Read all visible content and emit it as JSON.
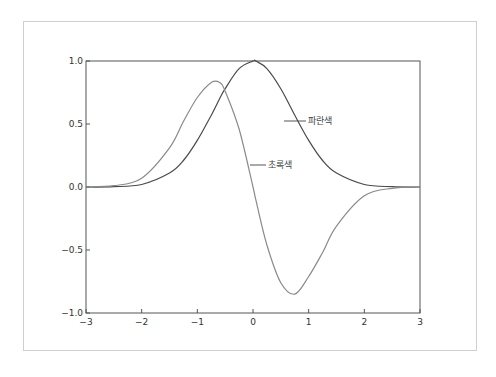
{
  "title": "",
  "chart_data": {
    "type": "line",
    "title": "",
    "xlabel": "",
    "ylabel": "",
    "xlim": [
      -3,
      3
    ],
    "ylim": [
      -1.0,
      1.0
    ],
    "grid": false,
    "legend": "none (inline annotations)",
    "x_ticks": [
      "−3",
      "−2",
      "−1",
      "0",
      "1",
      "2",
      "3"
    ],
    "y_ticks": [
      "1.0",
      "0.5",
      "0.0",
      "−0.5",
      "−1.0"
    ],
    "x": [
      -3.0,
      -2.5,
      -2.0,
      -1.5,
      -1.25,
      -1.0,
      -0.75,
      -0.6,
      -0.5,
      -0.25,
      0.0,
      0.05,
      0.25,
      0.5,
      0.75,
      1.0,
      1.25,
      1.5,
      2.0,
      2.5,
      3.0
    ],
    "series": [
      {
        "name": "파란색",
        "color": "#4a4a4a",
        "values": [
          0.0,
          0.002,
          0.02,
          0.11,
          0.21,
          0.37,
          0.57,
          0.7,
          0.78,
          0.94,
          1.0,
          1.0,
          0.94,
          0.78,
          0.57,
          0.37,
          0.21,
          0.11,
          0.02,
          0.002,
          0.0
        ]
      },
      {
        "name": "초록색",
        "color": "#8a8a8a",
        "values": [
          0.0,
          0.01,
          0.07,
          0.31,
          0.52,
          0.71,
          0.83,
          0.83,
          0.76,
          0.46,
          0.0,
          -0.1,
          -0.46,
          -0.76,
          -0.85,
          -0.71,
          -0.52,
          -0.31,
          -0.07,
          -0.01,
          0.0
        ]
      }
    ],
    "annotations": [
      {
        "text": "파란색",
        "x": 1.0,
        "y": 0.55
      },
      {
        "text": "초록색",
        "x": 0.2,
        "y": 0.25
      }
    ]
  },
  "axes": {
    "x_ticks": [
      {
        "label": "−3",
        "value": -3
      },
      {
        "label": "−2",
        "value": -2
      },
      {
        "label": "−1",
        "value": -1
      },
      {
        "label": "0",
        "value": 0
      },
      {
        "label": "1",
        "value": 1
      },
      {
        "label": "2",
        "value": 2
      },
      {
        "label": "3",
        "value": 3
      }
    ],
    "y_ticks": [
      {
        "label": "1.0",
        "value": 1.0
      },
      {
        "label": "0.5",
        "value": 0.5
      },
      {
        "label": "0.0",
        "value": 0.0
      },
      {
        "label": "−0.5",
        "value": -0.5
      },
      {
        "label": "−1.0",
        "value": -1.0
      }
    ]
  },
  "labels": {
    "blue": "파란색",
    "green": "초록색"
  }
}
